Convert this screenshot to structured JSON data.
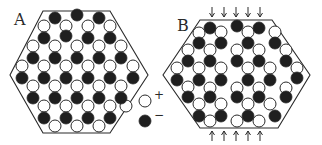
{
  "figure": {
    "panels": [
      {
        "label": "A",
        "label_pos": [
          14,
          26
        ],
        "hexagon": [
          [
            43,
            11
          ],
          [
            110,
            11
          ],
          [
            148,
            75
          ],
          [
            110,
            133
          ],
          [
            43,
            133
          ],
          [
            10,
            75
          ]
        ],
        "circles_black": [
          [
            55,
            18
          ],
          [
            77,
            15
          ],
          [
            99,
            18
          ],
          [
            44,
            38
          ],
          [
            66,
            36
          ],
          [
            88,
            38
          ],
          [
            110,
            38
          ],
          [
            33,
            58
          ],
          [
            55,
            58
          ],
          [
            77,
            58
          ],
          [
            99,
            58
          ],
          [
            121,
            58
          ],
          [
            22,
            78
          ],
          [
            44,
            78
          ],
          [
            66,
            78
          ],
          [
            88,
            78
          ],
          [
            110,
            78
          ],
          [
            133,
            78
          ],
          [
            33,
            98
          ],
          [
            55,
            98
          ],
          [
            77,
            98
          ],
          [
            99,
            98
          ],
          [
            121,
            98
          ],
          [
            44,
            118
          ],
          [
            66,
            118
          ],
          [
            88,
            118
          ],
          [
            110,
            118
          ]
        ],
        "circles_white": [
          [
            44,
            26
          ],
          [
            66,
            26
          ],
          [
            88,
            26
          ],
          [
            110,
            26
          ],
          [
            33,
            46
          ],
          [
            55,
            46
          ],
          [
            77,
            46
          ],
          [
            99,
            46
          ],
          [
            121,
            46
          ],
          [
            22,
            66
          ],
          [
            44,
            66
          ],
          [
            66,
            66
          ],
          [
            88,
            66
          ],
          [
            110,
            66
          ],
          [
            133,
            66
          ],
          [
            33,
            86
          ],
          [
            55,
            86
          ],
          [
            77,
            86
          ],
          [
            99,
            86
          ],
          [
            121,
            86
          ],
          [
            44,
            106
          ],
          [
            66,
            106
          ],
          [
            88,
            106
          ],
          [
            110,
            106
          ],
          [
            126,
            106
          ],
          [
            55,
            126
          ],
          [
            77,
            126
          ],
          [
            99,
            126
          ]
        ],
        "arrows_top": [],
        "arrows_bottom": []
      },
      {
        "label": "B",
        "label_pos": [
          177,
          32
        ],
        "hexagon": [
          [
            200,
            20
          ],
          [
            272,
            20
          ],
          [
            310,
            75
          ],
          [
            278,
            128
          ],
          [
            200,
            128
          ],
          [
            163,
            75
          ]
        ],
        "circles_black": [
          [
            210,
            28
          ],
          [
            237,
            26
          ],
          [
            259,
            28
          ],
          [
            199,
            43
          ],
          [
            221,
            43
          ],
          [
            248,
            43
          ],
          [
            275,
            43
          ],
          [
            188,
            61
          ],
          [
            210,
            61
          ],
          [
            237,
            61
          ],
          [
            259,
            61
          ],
          [
            286,
            61
          ],
          [
            177,
            80
          ],
          [
            199,
            80
          ],
          [
            221,
            80
          ],
          [
            248,
            80
          ],
          [
            270,
            80
          ],
          [
            297,
            78
          ],
          [
            188,
            97
          ],
          [
            210,
            97
          ],
          [
            237,
            97
          ],
          [
            259,
            97
          ],
          [
            286,
            97
          ],
          [
            199,
            116
          ],
          [
            221,
            116
          ],
          [
            248,
            116
          ],
          [
            275,
            116
          ]
        ],
        "circles_white": [
          [
            199,
            33
          ],
          [
            221,
            32
          ],
          [
            248,
            32
          ],
          [
            275,
            32
          ],
          [
            188,
            50
          ],
          [
            210,
            50
          ],
          [
            237,
            50
          ],
          [
            259,
            50
          ],
          [
            286,
            50
          ],
          [
            177,
            68
          ],
          [
            199,
            68
          ],
          [
            221,
            68
          ],
          [
            248,
            68
          ],
          [
            270,
            68
          ],
          [
            297,
            68
          ],
          [
            188,
            87
          ],
          [
            210,
            88
          ],
          [
            237,
            88
          ],
          [
            259,
            88
          ],
          [
            286,
            88
          ],
          [
            199,
            104
          ],
          [
            221,
            104
          ],
          [
            248,
            104
          ],
          [
            270,
            104
          ],
          [
            210,
            121
          ],
          [
            237,
            121
          ],
          [
            259,
            121
          ]
        ],
        "arrows_top": [
          212,
          224,
          236,
          248,
          260
        ],
        "arrows_bottom": [
          212,
          224,
          236,
          248,
          260
        ]
      }
    ],
    "legend": {
      "items": [
        {
          "kind": "white-circle",
          "sign": "+",
          "pos": [
            145,
            101
          ]
        },
        {
          "kind": "black-circle",
          "sign": "−",
          "pos": [
            145,
            121
          ]
        }
      ]
    },
    "colors": {
      "ink": "#2a2a2a",
      "black_fill": "#1f1f1f",
      "white_fill": "#ffffff",
      "background": "#ffffff"
    },
    "circle_radius": 6
  }
}
